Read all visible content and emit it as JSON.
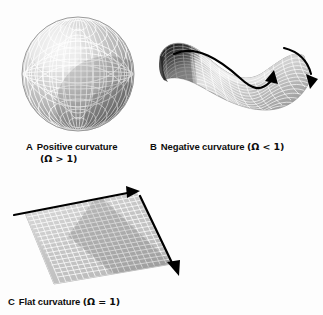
{
  "figure": {
    "background_color": "#fdfdfd",
    "ink_color": "#0d0d0d",
    "surface_light": "#e8e8e8",
    "surface_mid": "#b6b6b6",
    "surface_dark": "#4a4a4a",
    "gridline_color": "#ffffff"
  },
  "panels": [
    {
      "tag": "A",
      "label": "Positive curvature",
      "formula": "(Ω > 1)",
      "caption_full": "A  Positive curvature (Ω > 1)",
      "shape": "sphere",
      "shape_name": "sphere-wireframe",
      "omega_relation": ">",
      "omega_value": "1",
      "arrows": 0
    },
    {
      "tag": "B",
      "label": "Negative curvature",
      "formula": "(Ω < 1)",
      "caption_full": "B  Negative curvature (Ω < 1)",
      "shape": "saddle",
      "shape_name": "hyperbolic-saddle-wireframe",
      "omega_relation": "<",
      "omega_value": "1",
      "arrows": 2
    },
    {
      "tag": "C",
      "label": "Flat curvature",
      "formula": "(Ω = 1)",
      "caption_full": "C  Flat curvature (Ω = 1)",
      "shape": "plane",
      "shape_name": "flat-grid-plane",
      "omega_relation": "=",
      "omega_value": "1",
      "arrows": 2
    }
  ]
}
